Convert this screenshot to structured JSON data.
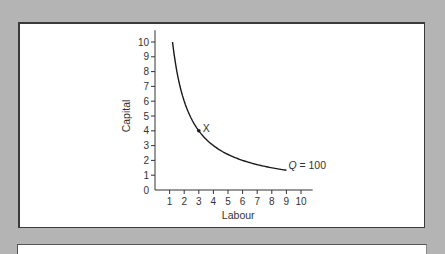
{
  "chart_data": {
    "type": "line",
    "title": "",
    "xlabel": "Labour",
    "ylabel": "Capital",
    "xlim": [
      0,
      10.8
    ],
    "ylim": [
      0,
      10.8
    ],
    "xticks": [
      1,
      2,
      3,
      4,
      5,
      6,
      7,
      8,
      9,
      10
    ],
    "yticks": [
      0,
      1,
      2,
      3,
      4,
      5,
      6,
      7,
      8,
      9,
      10
    ],
    "grid": false,
    "series": [
      {
        "name": "Q = 100",
        "label_italic_part": "Q",
        "label_rest": " = 100",
        "x": [
          1.2,
          1.5,
          2,
          2.5,
          3,
          4,
          5,
          6,
          7,
          8,
          9
        ],
        "y": [
          9.3,
          8.0,
          6.0,
          4.8,
          4.0,
          3.0,
          2.4,
          2.0,
          1.71,
          1.5,
          1.25
        ]
      }
    ],
    "annotations": [
      {
        "label": "X",
        "x": 3,
        "y": 4,
        "marker": "dot"
      }
    ]
  }
}
